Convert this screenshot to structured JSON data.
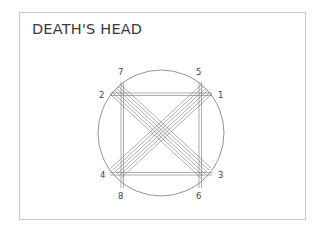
{
  "title": "DEATH'S HEAD",
  "diagram": {
    "points": [
      {
        "id": "1",
        "label": "1"
      },
      {
        "id": "2",
        "label": "2"
      },
      {
        "id": "3",
        "label": "3"
      },
      {
        "id": "4",
        "label": "4"
      },
      {
        "id": "5",
        "label": "5"
      },
      {
        "id": "6",
        "label": "6"
      },
      {
        "id": "7",
        "label": "7"
      },
      {
        "id": "8",
        "label": "8"
      }
    ],
    "line_color": "#555555",
    "circle_color": "#666666"
  }
}
